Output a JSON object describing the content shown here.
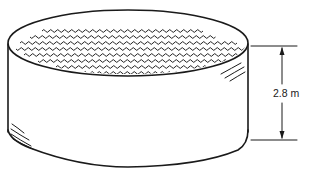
{
  "figure": {
    "dimension": {
      "quantity": "height",
      "value": 2.8,
      "unit": "m",
      "label": "2.8 m"
    },
    "colors": {
      "line": "#1a1a1a",
      "background": "#ffffff"
    }
  }
}
